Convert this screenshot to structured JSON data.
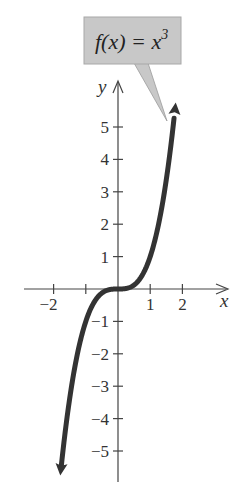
{
  "chart_data": {
    "type": "line",
    "title": "",
    "function": "f(x) = x^3",
    "annotation": {
      "text_main": "f(x) = x",
      "text_superscript": "3",
      "background": "#c8c8c8"
    },
    "xlabel": "x",
    "ylabel": "y",
    "xlim": [
      -2.9,
      3.4
    ],
    "ylim": [
      -6,
      6
    ],
    "x_ticks": [
      -2,
      -1,
      1,
      2
    ],
    "x_tick_labels": [
      "−2",
      "",
      "1",
      "2"
    ],
    "y_ticks": [
      -5,
      -4,
      -3,
      -2,
      -1,
      1,
      2,
      3,
      4,
      5
    ],
    "y_tick_labels": [
      "−5",
      "−4",
      "−3",
      "−2",
      "−1",
      "1",
      "2",
      "3",
      "4",
      "5"
    ],
    "grid": false,
    "legend": null,
    "series": [
      {
        "name": "f(x) = x^3",
        "color": "#333333",
        "x": [
          -1.8,
          -1.6,
          -1.4,
          -1.2,
          -1.0,
          -0.8,
          -0.6,
          -0.4,
          -0.2,
          0,
          0.2,
          0.4,
          0.6,
          0.8,
          1.0,
          1.2,
          1.4,
          1.6,
          1.8
        ],
        "y": [
          -5.832,
          -4.096,
          -2.744,
          -1.728,
          -1.0,
          -0.512,
          -0.216,
          -0.064,
          -0.008,
          0,
          0.008,
          0.064,
          0.216,
          0.512,
          1.0,
          1.728,
          2.744,
          4.096,
          5.832
        ]
      }
    ],
    "arrows_at_ends": true
  }
}
